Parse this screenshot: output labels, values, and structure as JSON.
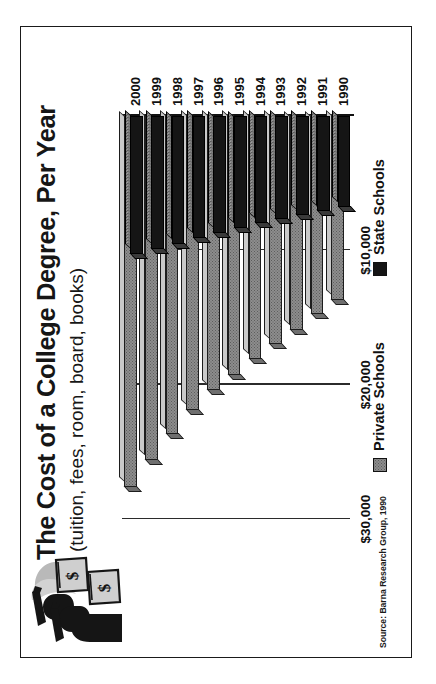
{
  "header": {
    "title": "The Cost of a College Degree, Per Year",
    "subtitle": "(tuition, fees, room, board, books)",
    "illustration_name": "graduates-with-money-bags"
  },
  "source": "Source: Barna Research Group, 1990",
  "legend": {
    "position": "bottom",
    "items": [
      {
        "label": "Private Schools",
        "color": "#8d8d8d"
      },
      {
        "label": "State Schools",
        "color": "#151515"
      }
    ]
  },
  "chart_data": {
    "type": "bar",
    "orientation": "horizontal",
    "title": "The Cost of a College Degree, Per Year",
    "subtitle": "(tuition, fees, room, board, books)",
    "xlabel": "",
    "ylabel": "",
    "categories": [
      "1990",
      "1991",
      "1992",
      "1993",
      "1994",
      "1995",
      "1996",
      "1997",
      "1998",
      "1999",
      "2000"
    ],
    "tick_labels": [
      "$10,000",
      "$20,000",
      "$30,000"
    ],
    "tick_values": [
      10000,
      20000,
      30000
    ],
    "value_axis_range": [
      0,
      32000
    ],
    "grid": true,
    "series": [
      {
        "name": "Private Schools",
        "color": "#8d8d8d",
        "values": [
          13700,
          14700,
          15900,
          17000,
          18100,
          19300,
          20400,
          21900,
          23700,
          25600,
          27600
        ]
      },
      {
        "name": "State Schools",
        "color": "#151515",
        "values": [
          6800,
          7100,
          7400,
          7700,
          8000,
          8300,
          8700,
          9100,
          9500,
          9900,
          10300
        ]
      }
    ],
    "legend_position": "bottom",
    "source": "Source: Barna Research Group, 1990"
  }
}
